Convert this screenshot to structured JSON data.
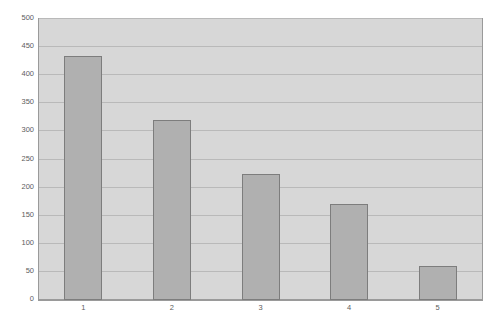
{
  "chart_data": {
    "type": "bar",
    "title": "",
    "subtitle": "",
    "xlabel": "",
    "ylabel": "",
    "categories": [
      "1",
      "2",
      "3",
      "4",
      "5"
    ],
    "values": [
      435,
      320,
      225,
      170,
      60
    ],
    "ylim": [
      0,
      500
    ],
    "ytick_labels": [
      "0",
      "50",
      "100",
      "150",
      "200",
      "250",
      "300",
      "350",
      "400",
      "450",
      "500"
    ],
    "ytick_values": [
      0,
      50,
      100,
      150,
      200,
      250,
      300,
      350,
      400,
      450,
      500
    ],
    "grid": "horizontal",
    "legend": "none",
    "annotations": [],
    "colors": {
      "bar_fill": "#b0b0b0",
      "bar_border": "#7d7d7d",
      "plot_background": "#d7d7d7",
      "plot_border": "#9a9a9a",
      "gridline": "#b9b9b9",
      "axis_label": "#5d5d5d",
      "page_background": "#ffffff"
    }
  }
}
